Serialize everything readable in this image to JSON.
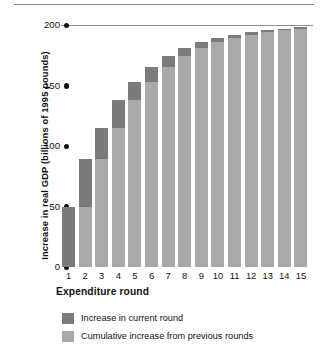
{
  "chart_data": {
    "type": "bar",
    "subtype": "stacked-bar",
    "title": "",
    "xlabel": "Expenditure round",
    "ylabel": "Increase in real GDP (billions of 1995 pounds)",
    "categories": [
      "1",
      "2",
      "3",
      "4",
      "5",
      "6",
      "7",
      "8",
      "9",
      "10",
      "11",
      "12",
      "13",
      "14",
      "15"
    ],
    "ylim": [
      0,
      200
    ],
    "yticks": [
      0,
      50,
      100,
      150,
      200
    ],
    "ytick_labels": [
      "0",
      "50",
      "100",
      "150",
      "200"
    ],
    "grid": false,
    "gridline_at": 200,
    "legend_position": "bottom-left",
    "series": [
      {
        "name": "Cumulative increase from previous rounds",
        "color": "#a9a9a9",
        "values": [
          0,
          50,
          89,
          115,
          138,
          153,
          165,
          174,
          181,
          186,
          189,
          192,
          194,
          196,
          197
        ]
      },
      {
        "name": "Increase in current round",
        "color": "#7b7b7b",
        "values": [
          50,
          39,
          26,
          23,
          15,
          12,
          9,
          7,
          5,
          3,
          3,
          2,
          2,
          1,
          1
        ]
      }
    ],
    "totals": [
      50,
      89,
      115,
      138,
      153,
      165,
      174,
      181,
      186,
      189,
      192,
      194,
      196,
      197,
      198
    ]
  },
  "legend": {
    "items": [
      {
        "label": "Increase in current round",
        "color": "#7b7b7b"
      },
      {
        "label": "Cumulative increase from previous rounds",
        "color": "#a9a9a9"
      }
    ]
  },
  "colors": {
    "current_round": "#7b7b7b",
    "cumulative": "#a9a9a9",
    "axis": "#111111",
    "rule": "#8c8c8c",
    "background": "#ffffff"
  }
}
